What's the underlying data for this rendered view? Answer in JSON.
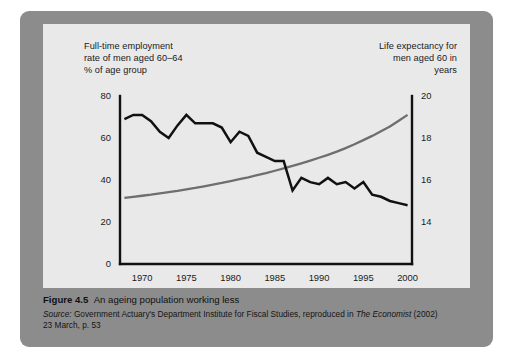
{
  "figure": {
    "number_label": "Figure 4.5",
    "title_text": "An ageing population working less",
    "source_prefix": "Source:",
    "source_body": " Government Actuary's Department Institute for Fiscal Studies, reproduced in ",
    "source_publication": "The Economist",
    "source_suffix": " (2002)",
    "source_line2": "23 March, p. 53"
  },
  "left_axis_title": {
    "line1": "Full-time employment",
    "line2": "rate of men aged 60–64",
    "line3": "% of age group"
  },
  "right_axis_title": {
    "line1": "Life expectancy for",
    "line2": "men aged 60 in",
    "line3": "years"
  },
  "colors": {
    "panel": "#8c8c8c",
    "card": "#e9e9e9",
    "employment_line": "#111111",
    "life_line": "#6e6e6e",
    "axis": "#111111",
    "text": "#1a1a1a"
  },
  "chart_data": {
    "type": "line",
    "title": "An ageing population working less",
    "xlabel": "",
    "ylabel": "% of age group",
    "y2label": "years",
    "grid": false,
    "legend": "none",
    "x": [
      1968,
      1969,
      1970,
      1971,
      1972,
      1973,
      1974,
      1975,
      1976,
      1977,
      1978,
      1979,
      1980,
      1981,
      1982,
      1983,
      1984,
      1985,
      1986,
      1987,
      1988,
      1989,
      1990,
      1991,
      1992,
      1993,
      1994,
      1995,
      1996,
      1997,
      1998,
      1999,
      2000
    ],
    "xtick_labels": [
      "1970",
      "1975",
      "1980",
      "1985",
      "1990",
      "1995",
      "2000"
    ],
    "xticks": [
      1970,
      1975,
      1980,
      1985,
      1990,
      1995,
      2000
    ],
    "xlim": [
      1967.5,
      2000.5
    ],
    "ylim": [
      0,
      80
    ],
    "yticks": [
      0,
      20,
      40,
      60,
      80
    ],
    "ytick_labels": [
      "0",
      "20",
      "40",
      "60",
      "80"
    ],
    "y2lim": [
      12,
      20
    ],
    "y2ticks": [
      14,
      16,
      18,
      20
    ],
    "y2tick_labels": [
      "14",
      "16",
      "18",
      "20"
    ],
    "series": [
      {
        "name": "Full-time employment rate of men aged 60-64 (% of age group)",
        "axis": "left",
        "color": "#111111",
        "values": [
          69,
          71,
          71,
          68,
          63,
          60,
          66,
          71,
          67,
          67,
          67,
          65,
          58,
          63,
          61,
          53,
          51,
          49,
          49,
          35,
          41,
          39,
          38,
          41,
          38,
          39,
          36,
          39,
          33,
          32,
          30,
          29,
          28
        ]
      },
      {
        "name": "Life expectancy for men aged 60 (years)",
        "axis": "right",
        "color": "#6e6e6e",
        "values": [
          15.15,
          15.2,
          15.25,
          15.3,
          15.36,
          15.42,
          15.48,
          15.55,
          15.62,
          15.7,
          15.78,
          15.86,
          15.95,
          16.04,
          16.13,
          16.23,
          16.33,
          16.44,
          16.55,
          16.67,
          16.79,
          16.92,
          17.06,
          17.2,
          17.35,
          17.52,
          17.7,
          17.9,
          18.1,
          18.32,
          18.55,
          18.82,
          19.1
        ]
      }
    ],
    "extra_employment_detail": {
      "note": "Series is a jagged annual line with a steep fall between 1980 and 1987, a trough near 1994-1995, then a slight rise to 2000.",
      "trough_value": 22,
      "peak_value": 71
    }
  }
}
